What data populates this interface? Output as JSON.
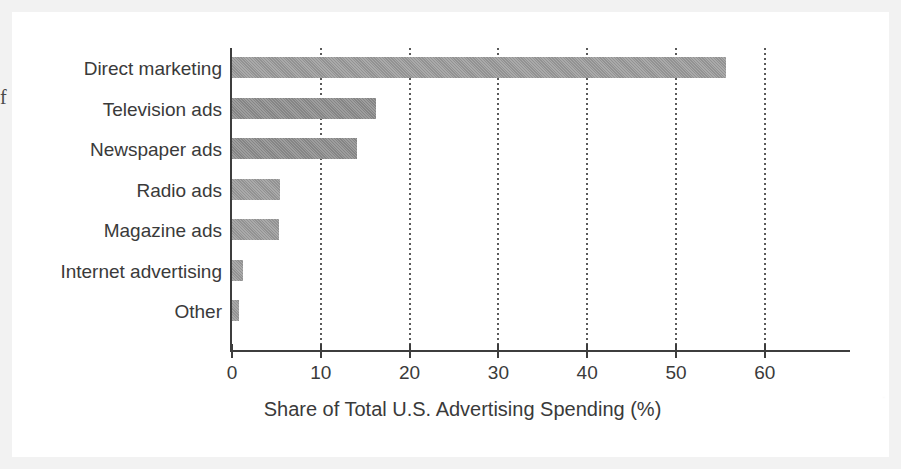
{
  "figure": {
    "clipped_margin_glyph": "f",
    "ghost_text": "·"
  },
  "chart_data": {
    "type": "bar",
    "orientation": "horizontal",
    "title": "",
    "xlabel": "Share of Total U.S. Advertising Spending (%)",
    "ylabel": "",
    "categories": [
      "Direct marketing",
      "Television ads",
      "Newspaper ads",
      "Radio ads",
      "Magazine ads",
      "Internet advertising",
      "Other"
    ],
    "values": [
      55.7,
      16.3,
      14.2,
      5.5,
      5.4,
      1.3,
      0.9
    ],
    "xlim": [
      0,
      68
    ],
    "xticks": [
      0,
      10,
      20,
      30,
      40,
      50,
      60
    ],
    "xtick_labels": [
      "0",
      "10",
      "20",
      "30",
      "40",
      "50",
      "60"
    ],
    "grid": "vertical-dotted",
    "legend": "none",
    "bar_color": "#9a9a9a",
    "axis_color": "#3d3d3d",
    "text_color": "#3a3a3a",
    "background_color": "#ffffff"
  }
}
